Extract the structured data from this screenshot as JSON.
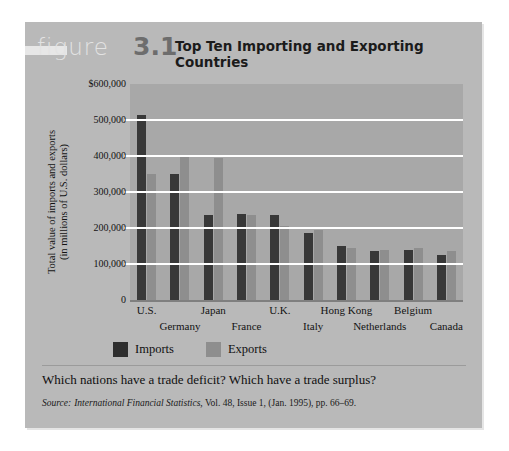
{
  "figure": {
    "word": "figure",
    "number": "3.1",
    "title": "Top Ten Importing and Exporting Countries"
  },
  "caption": {
    "question": "Which nations have a trade deficit? Which have a trade surplus?",
    "source_prefix": "Source:",
    "source_italic": "International Financial Statistics,",
    "source_rest": " Vol. 48, Issue 1, (Jan. 1995), pp. 66–69."
  },
  "colors": {
    "card_bg": "#b9b9b9",
    "plot_bg": "#a8a8a8",
    "imports": "#383838",
    "exports": "#8e8e8e",
    "gridline": "#ffffff"
  },
  "chart_data": {
    "type": "bar",
    "title": "Top Ten Importing and Exporting Countries",
    "xlabel": "",
    "ylabel": "Total value of imports and exports (in millions of U.S. dollars)",
    "ylabel_line1": "Total value of imports and exports",
    "ylabel_line2": "(in millions of U.S. dollars)",
    "categories": [
      "U.S.",
      "Germany",
      "Japan",
      "France",
      "U.K.",
      "Italy",
      "Hong Kong",
      "Netherlands",
      "Belgium",
      "Canada"
    ],
    "series": [
      {
        "name": "Imports",
        "values": [
          515000,
          350000,
          235000,
          240000,
          235000,
          185000,
          150000,
          135000,
          140000,
          125000
        ]
      },
      {
        "name": "Exports",
        "values": [
          350000,
          400000,
          395000,
          235000,
          205000,
          195000,
          145000,
          140000,
          145000,
          135000
        ]
      }
    ],
    "ylim": [
      0,
      600000
    ],
    "ytick_values": [
      0,
      100000,
      200000,
      300000,
      400000,
      500000,
      600000
    ],
    "ytick_labels": [
      "0",
      "100,000",
      "200,000",
      "300,000",
      "400,000",
      "500,000",
      "$600,000"
    ],
    "grid": true,
    "legend_position": "bottom-left",
    "legend": [
      "Imports",
      "Exports"
    ]
  }
}
